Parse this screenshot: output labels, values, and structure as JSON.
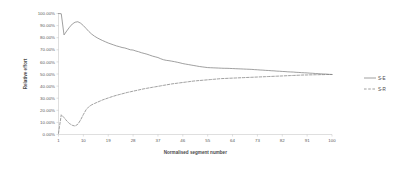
{
  "chart_data": {
    "type": "line",
    "title": "",
    "xlabel": "Normalised segment number",
    "ylabel": "Relative effort",
    "xlim": [
      1,
      100
    ],
    "ylim": [
      0,
      100
    ],
    "grid": false,
    "legend_position": "right",
    "x_ticks": [
      "1",
      "10",
      "19",
      "28",
      "37",
      "46",
      "55",
      "64",
      "73",
      "82",
      "91",
      "100"
    ],
    "x_tick_values": [
      1,
      10,
      19,
      28,
      37,
      46,
      55,
      64,
      73,
      82,
      91,
      100
    ],
    "y_ticks": [
      "0.00%",
      "10.00%",
      "20.00%",
      "30.00%",
      "40.00%",
      "50.00%",
      "60.00%",
      "70.00%",
      "80.00%",
      "90.00%",
      "100.00%"
    ],
    "y_tick_values": [
      0,
      10,
      20,
      30,
      40,
      50,
      60,
      70,
      80,
      90,
      100
    ],
    "x": [
      1,
      2,
      3,
      4,
      5,
      6,
      7,
      8,
      9,
      10,
      11,
      12,
      13,
      14,
      15,
      16,
      17,
      18,
      19,
      20,
      21,
      22,
      23,
      24,
      25,
      26,
      27,
      28,
      29,
      30,
      31,
      32,
      33,
      34,
      35,
      36,
      37,
      38,
      39,
      40,
      41,
      42,
      43,
      44,
      45,
      46,
      47,
      48,
      49,
      50,
      51,
      52,
      53,
      54,
      55,
      56,
      57,
      58,
      59,
      60,
      61,
      62,
      63,
      64,
      65,
      66,
      67,
      68,
      69,
      70,
      71,
      72,
      73,
      74,
      75,
      76,
      77,
      78,
      79,
      80,
      81,
      82,
      83,
      84,
      85,
      86,
      87,
      88,
      89,
      90,
      91,
      92,
      93,
      94,
      95,
      96,
      97,
      98,
      99,
      100
    ],
    "series": [
      {
        "name": "S-E",
        "style": "solid",
        "color": "#808080",
        "values": [
          100.0,
          99.8,
          82.3,
          85.6,
          88.7,
          91.3,
          92.8,
          93.2,
          92.0,
          90.0,
          87.6,
          85.1,
          83.0,
          81.3,
          79.9,
          78.7,
          77.6,
          76.6,
          75.6,
          74.8,
          74.0,
          73.2,
          72.6,
          71.9,
          71.5,
          70.8,
          70.0,
          69.8,
          69.0,
          68.4,
          67.6,
          67.0,
          66.4,
          65.6,
          64.8,
          64.2,
          63.6,
          62.6,
          61.8,
          61.3,
          61.0,
          60.6,
          60.2,
          59.7,
          59.2,
          58.6,
          58.2,
          57.8,
          57.4,
          57.0,
          56.6,
          56.2,
          55.9,
          55.6,
          55.3,
          55.2,
          55.1,
          55.0,
          54.9,
          54.8,
          54.7,
          54.7,
          54.6,
          54.5,
          54.4,
          54.3,
          54.2,
          54.1,
          54.0,
          53.9,
          53.8,
          53.6,
          53.5,
          53.3,
          53.2,
          53.0,
          52.9,
          52.7,
          52.6,
          52.4,
          52.3,
          52.1,
          52.0,
          51.8,
          51.7,
          51.6,
          51.4,
          51.3,
          51.1,
          51.0,
          50.9,
          50.7,
          50.6,
          50.4,
          50.3,
          50.1,
          50.0,
          49.9,
          49.7,
          49.6
        ],
        "description": "Solid grey line. Starts at 100%, drops sharply to ~82% at segment 3, recovers to a local peak ~93% near segment 8, then decays monotonically to ~50% at segment 100."
      },
      {
        "name": "S-R",
        "style": "dashed",
        "color": "#808080",
        "values": [
          1.0,
          16.3,
          14.0,
          11.2,
          9.0,
          7.6,
          7.0,
          8.5,
          12.0,
          16.5,
          20.5,
          23.0,
          24.5,
          25.6,
          26.6,
          27.6,
          28.6,
          29.4,
          30.2,
          31.0,
          31.7,
          32.4,
          33.0,
          33.6,
          34.2,
          34.8,
          35.3,
          35.8,
          36.3,
          36.8,
          37.3,
          37.8,
          38.2,
          38.6,
          39.0,
          39.4,
          39.8,
          40.2,
          40.6,
          41.0,
          41.4,
          41.8,
          42.1,
          42.4,
          42.7,
          43.0,
          43.3,
          43.6,
          43.9,
          44.2,
          44.4,
          44.6,
          44.8,
          45.0,
          45.2,
          45.4,
          45.6,
          45.8,
          46.0,
          46.2,
          46.3,
          46.4,
          46.5,
          46.6,
          46.7,
          46.8,
          46.9,
          47.0,
          47.1,
          47.2,
          47.3,
          47.4,
          47.5,
          47.6,
          47.7,
          47.8,
          47.9,
          48.0,
          48.1,
          48.2,
          48.3,
          48.4,
          48.5,
          48.6,
          48.7,
          48.8,
          48.9,
          49.0,
          49.1,
          49.2,
          49.2,
          49.3,
          49.3,
          49.4,
          49.4,
          49.5,
          49.5,
          49.6,
          49.6,
          49.6
        ],
        "description": "Dashed grey line. Starts near 0%, spikes to ~16% at segment 2, dips to a minimum ~7% near segment 7, then rises steadily and asymptotes to ~50% at segment 100."
      }
    ]
  },
  "legend": {
    "items": [
      {
        "label": "S-E",
        "style": "solid"
      },
      {
        "label": "S-R",
        "style": "dashed"
      }
    ]
  }
}
